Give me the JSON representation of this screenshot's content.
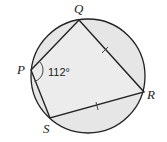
{
  "diagram": {
    "type": "cyclic-quadrilateral",
    "circle": {
      "cx": 88,
      "cy": 76,
      "r": 57,
      "fill": "#e6e6e6",
      "stroke": "#222222"
    },
    "vertices": {
      "P": {
        "label": "P",
        "x": 31,
        "y": 70
      },
      "Q": {
        "label": "Q",
        "x": 79,
        "y": 20
      },
      "R": {
        "label": "R",
        "x": 144,
        "y": 92
      },
      "S": {
        "label": "S",
        "x": 50,
        "y": 118
      }
    },
    "angle_P": {
      "label": "112°"
    },
    "equal_sides": [
      "QR",
      "RS"
    ]
  }
}
